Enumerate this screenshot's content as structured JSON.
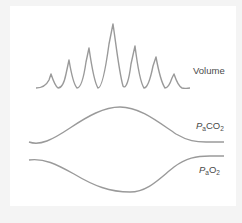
{
  "diagram": {
    "colors": {
      "line": "#9a9a9a",
      "text": "#4a4a4a",
      "background": "#ffffff",
      "frame": "#f4f4f4"
    },
    "labels": {
      "volume": "Volume",
      "paco2": {
        "p": "P",
        "sub_a": "a",
        "gas": "CO",
        "sub_2": "2"
      },
      "pao2": {
        "p": "P",
        "sub_a": "a",
        "gas": "O",
        "sub_2": "2"
      }
    },
    "traces": [
      {
        "name": "Volume",
        "pattern": "crescendo-decrescendo breaths (Cheyne-Stokes)",
        "relative_peak_amplitudes": [
          0.22,
          0.45,
          0.63,
          1.0,
          0.66,
          0.48,
          0.22
        ]
      },
      {
        "name": "PaCO2",
        "pattern": "rises to a maximum mid-cycle then returns to baseline"
      },
      {
        "name": "PaO2",
        "pattern": "falls to a minimum mid-cycle then returns to baseline"
      }
    ]
  }
}
